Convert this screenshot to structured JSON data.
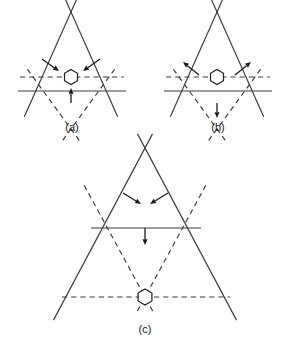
{
  "figure": {
    "background_color": "#ffffff",
    "line_color": "#3a3a3e",
    "arrow_color": "#1b1b1f",
    "node_fill": "#ffffff",
    "panels": [
      {
        "id": "a",
        "label": "(a)",
        "label_x": 72,
        "label_y": 131,
        "node": {
          "x": 71,
          "y": 77,
          "radius": 7.5,
          "sides": 6,
          "shape": "hexagon"
        },
        "arrow_mode": "inward",
        "arrow_count": 3,
        "arrows": [
          {
            "name": "arrow-upper-left-inward",
            "x1": 42,
            "y1": 59,
            "x2": 59,
            "y2": 71,
            "direction": "inward"
          },
          {
            "name": "arrow-upper-right-inward",
            "x1": 100,
            "y1": 59,
            "x2": 83,
            "y2": 71,
            "direction": "inward"
          },
          {
            "name": "arrow-bottom-upward",
            "x1": 71,
            "y1": 103,
            "x2": 71,
            "y2": 88,
            "direction": "inward"
          }
        ],
        "solid_triangle": {
          "apex": {
            "x": 71,
            "y": 12
          },
          "left": {
            "x": 30,
            "y": 104
          },
          "right": {
            "x": 112,
            "y": 104
          },
          "overshoot": 14
        },
        "solid_base": {
          "x1": 18,
          "y1": 91,
          "x2": 126,
          "y2": 91
        },
        "dashed_triangle": {
          "base_y": 77,
          "apex": {
            "x": 71,
            "y": 129
          },
          "left": {
            "x": 33,
            "y": 77
          },
          "right": {
            "x": 109,
            "y": 77
          },
          "overshoot": 14
        },
        "dashed_horizontal": {
          "x1": 20,
          "y1": 77,
          "x2": 124,
          "y2": 77
        }
      },
      {
        "id": "b",
        "label": "(b)",
        "label_x": 218,
        "label_y": 131,
        "node": {
          "x": 217,
          "y": 77,
          "radius": 7.5,
          "sides": 6,
          "shape": "hexagon"
        },
        "arrow_mode": "outward",
        "arrow_count": 3,
        "arrows": [
          {
            "name": "arrow-upper-left-outward",
            "x1": 199,
            "y1": 75,
            "x2": 183,
            "y2": 62,
            "direction": "outward"
          },
          {
            "name": "arrow-upper-right-outward",
            "x1": 235,
            "y1": 75,
            "x2": 251,
            "y2": 62,
            "direction": "outward"
          },
          {
            "name": "arrow-bottom-downward",
            "x1": 217,
            "y1": 103,
            "x2": 217,
            "y2": 118,
            "direction": "outward"
          }
        ],
        "solid_triangle": {
          "apex": {
            "x": 217,
            "y": 12
          },
          "left": {
            "x": 176,
            "y": 104
          },
          "right": {
            "x": 258,
            "y": 104
          },
          "overshoot": 14
        },
        "solid_base": {
          "x1": 164,
          "y1": 91,
          "x2": 272,
          "y2": 91
        },
        "dashed_triangle": {
          "base_y": 77,
          "apex": {
            "x": 217,
            "y": 129
          },
          "left": {
            "x": 179,
            "y": 77
          },
          "right": {
            "x": 255,
            "y": 77
          },
          "overshoot": 14
        },
        "dashed_horizontal": {
          "x1": 166,
          "y1": 77,
          "x2": 270,
          "y2": 77
        }
      },
      {
        "id": "c",
        "label": "(c)",
        "label_x": 145,
        "label_y": 333,
        "node": {
          "x": 145,
          "y": 297,
          "radius": 8.0,
          "sides": 6,
          "shape": "hexagon"
        },
        "arrow_mode": "inward",
        "arrow_count": 3,
        "arrows": [
          {
            "name": "arrow-upper-left-inward",
            "x1": 123,
            "y1": 193,
            "x2": 141,
            "y2": 204,
            "direction": "inward"
          },
          {
            "name": "arrow-upper-right-inward",
            "x1": 168,
            "y1": 193,
            "x2": 150,
            "y2": 204,
            "direction": "inward"
          },
          {
            "name": "arrow-middle-downward",
            "x1": 145,
            "y1": 228,
            "x2": 145,
            "y2": 245,
            "direction": "inward"
          }
        ],
        "solid_triangle": {
          "apex": {
            "x": 145,
            "y": 148
          },
          "left": {
            "x": 61,
            "y": 306
          },
          "right": {
            "x": 229,
            "y": 306
          },
          "overshoot": 16
        },
        "solid_base": {
          "x1": 91,
          "y1": 228,
          "x2": 201,
          "y2": 228
        },
        "dashed_triangle": {
          "base_y": 297,
          "apex": {
            "x": 145,
            "y": 297
          },
          "left": {
            "x": 90,
            "y": 196
          },
          "right": {
            "x": 200,
            "y": 196
          },
          "overshoot": 16
        },
        "dashed_horizontal": {
          "x1": 62,
          "y1": 297,
          "x2": 230,
          "y2": 297
        }
      }
    ]
  }
}
